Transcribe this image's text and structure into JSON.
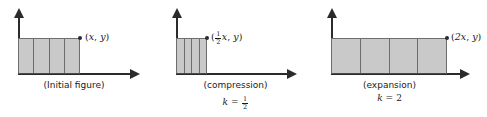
{
  "diagram": {
    "fill_color": "#c9c9c9",
    "stroke_color": "#6d6d6d",
    "axis_color": "#2b2b2b",
    "column_count": 4
  },
  "panels": [
    {
      "id": "initial",
      "caption": "(Initial figure)",
      "k_prefix": "k",
      "k_equals": "=",
      "k_value": "1",
      "k_visible": false,
      "point_open": "(",
      "point_x": "x",
      "point_comma": ",",
      "point_y": "y",
      "point_close": ")",
      "point_label_text": "(x, y)",
      "scale": 1
    },
    {
      "id": "compression",
      "caption": "(compression)",
      "k_prefix": "k",
      "k_equals": "=",
      "k_numerator": "1",
      "k_denominator": "2",
      "k_value": "1/2",
      "k_visible": true,
      "point_open": "(",
      "point_frac_num": "1",
      "point_frac_den": "2",
      "point_x": "x",
      "point_comma": ",",
      "point_y": "y",
      "point_close": ")",
      "point_label_text": "(1/2 x, y)",
      "scale": 0.5
    },
    {
      "id": "expansion",
      "caption": "(expansion)",
      "k_prefix": "k",
      "k_equals": "=",
      "k_value": "2",
      "k_visible": true,
      "point_open": "(",
      "point_x": "2x",
      "point_comma": ",",
      "point_y": "y",
      "point_close": ")",
      "point_label_text": "(2x, y)",
      "scale": 2
    }
  ]
}
